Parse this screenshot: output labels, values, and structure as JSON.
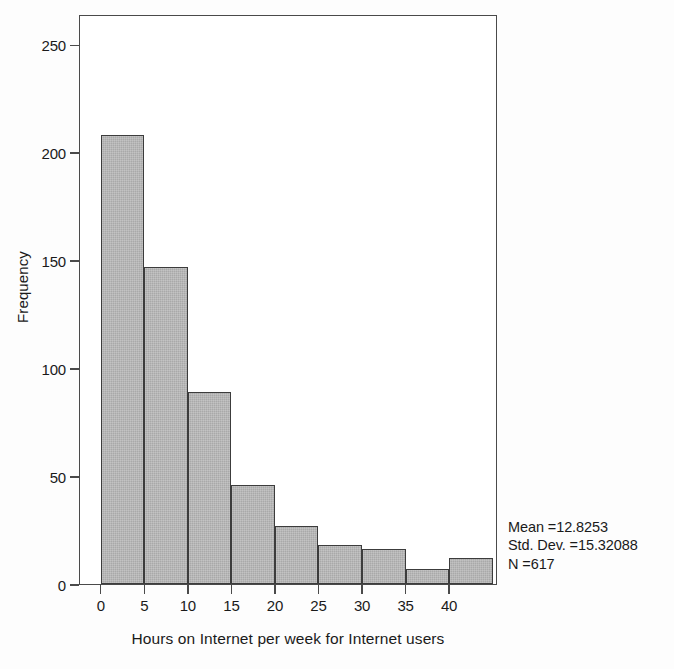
{
  "chart_data": {
    "type": "bar",
    "chart_subtype": "histogram",
    "title": "",
    "xlabel": "Hours on Internet per week for Internet users",
    "ylabel": "Frequency",
    "bin_width": 5,
    "bin_starts": [
      0,
      5,
      10,
      15,
      20,
      25,
      30,
      35,
      40
    ],
    "categories": [
      "0-5",
      "5-10",
      "10-15",
      "15-20",
      "20-25",
      "25-30",
      "30-35",
      "35-40",
      "40-45"
    ],
    "values": [
      208,
      147,
      89,
      46,
      27,
      18,
      16,
      7,
      12
    ],
    "xlim": [
      -2.5,
      45.5
    ],
    "ylim": [
      0,
      264
    ],
    "xticks": [
      0,
      5,
      10,
      15,
      20,
      25,
      30,
      35,
      40
    ],
    "xtick_labels": [
      "0",
      "5",
      "10",
      "15",
      "20",
      "25",
      "30",
      "35",
      "40"
    ],
    "yticks": [
      0,
      50,
      100,
      150,
      200,
      250
    ],
    "ytick_labels": [
      "0",
      "50",
      "100",
      "150",
      "200",
      "250"
    ],
    "grid": false,
    "legend": false,
    "bar_fill_color": "#a9a9a9",
    "bar_edge_color": "#3c3c3c",
    "axis_color": "#4a4a4a",
    "background_color": "#ffffff",
    "annotations": [
      "Mean =12.8253",
      "Std. Dev. =15.32088",
      "N =617"
    ]
  },
  "stats": {
    "mean_line": "Mean =12.8253",
    "stddev_line": "Std. Dev. =15.32088",
    "n_line": "N =617"
  }
}
